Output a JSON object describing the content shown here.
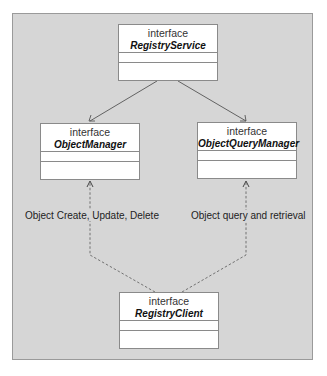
{
  "diagram": {
    "type": "UML interface diagram",
    "nodes": [
      {
        "id": "registry_service",
        "stereotype": "interface",
        "name": "RegistryService"
      },
      {
        "id": "object_manager",
        "stereotype": "interface",
        "name": "ObjectManager"
      },
      {
        "id": "object_query_manager",
        "stereotype": "interface",
        "name": "ObjectQueryManager"
      },
      {
        "id": "registry_client",
        "stereotype": "interface",
        "name": "RegistryClient"
      }
    ],
    "edges": [
      {
        "from": "registry_service",
        "to": "object_manager",
        "style": "solid",
        "arrow": "open"
      },
      {
        "from": "registry_service",
        "to": "object_query_manager",
        "style": "solid",
        "arrow": "open"
      },
      {
        "from": "registry_client",
        "to": "object_manager",
        "style": "dashed",
        "arrow": "open",
        "label": "Object Create, Update, Delete"
      },
      {
        "from": "registry_client",
        "to": "object_query_manager",
        "style": "dashed",
        "arrow": "open",
        "label": "Object query and retrieval"
      }
    ]
  },
  "colors": {
    "background": "#d6d6d6",
    "box_fill": "#ffffff",
    "line": "#555555"
  }
}
